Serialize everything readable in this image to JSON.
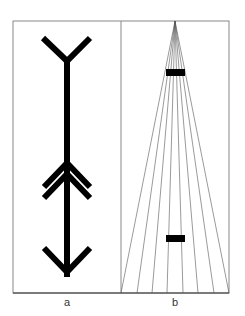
{
  "figure": {
    "frame": {
      "x1": 13,
      "y1": 21,
      "x2": 229,
      "y2": 293,
      "divider_x": 121,
      "stroke": "#888888"
    },
    "panels": [
      {
        "id": "a",
        "label": "a",
        "label_pos": {
          "x": 67,
          "y": 297
        },
        "description": "Arrow with forked tail, double chevron, and downward arrowhead",
        "arrow": {
          "shaft_x": 67,
          "shaft_top": 61,
          "shaft_bottom": 277,
          "stroke_width": 6,
          "top_fork": {
            "left": [
              43,
              38
            ],
            "right": [
              90,
              38
            ],
            "junction": [
              67,
              61
            ]
          },
          "chevrons": [
            {
              "apex": [
                67,
                163
              ],
              "left": [
                44,
                187
              ],
              "right": [
                90,
                187
              ]
            },
            {
              "apex": [
                67,
                174
              ],
              "left": [
                44,
                198
              ],
              "right": [
                90,
                198
              ]
            }
          ],
          "head": {
            "left": [
              44,
              248
            ],
            "right": [
              90,
              248
            ],
            "tip": [
              67,
              272
            ]
          },
          "color": "#000000"
        }
      },
      {
        "id": "b",
        "label": "b",
        "label_pos": {
          "x": 175,
          "y": 297
        },
        "description": "Converging lines (Ponzo illusion) with two equal bars",
        "apex": [
          175,
          21
        ],
        "ray_ends_x": [
          121,
          137,
          152,
          167,
          183,
          198,
          214,
          229
        ],
        "ray_end_y": 293,
        "bars": [
          {
            "name": "upper-bar",
            "x": 166,
            "y": 69,
            "w": 19,
            "h": 7
          },
          {
            "name": "lower-bar",
            "x": 166,
            "y": 235,
            "w": 19,
            "h": 7
          }
        ],
        "ray_color": "#555555",
        "bar_color": "#000000"
      }
    ]
  }
}
